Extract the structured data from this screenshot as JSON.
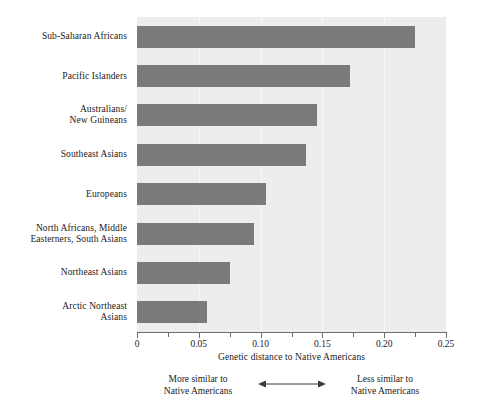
{
  "chart_data": {
    "type": "bar",
    "orientation": "horizontal",
    "title": "",
    "xlabel": "Genetic distance to Native Americans",
    "ylabel": "",
    "xlim": [
      0,
      0.25
    ],
    "grid": true,
    "legend": null,
    "categories": [
      "Sub-Saharan Africans",
      "Pacific Islanders",
      "Australians/\nNew Guineans",
      "Southeast Asians",
      "Europeans",
      "North Africans, Middle\nEasterners, South Asians",
      "Northeast Asians",
      "Arctic Northeast\nAsians"
    ],
    "values": [
      0.225,
      0.172,
      0.146,
      0.137,
      0.104,
      0.095,
      0.075,
      0.057
    ],
    "xticks": [
      0,
      0.025,
      0.05,
      0.075,
      0.1,
      0.125,
      0.15,
      0.175,
      0.2,
      0.225,
      0.25
    ],
    "xtick_labels": [
      "0",
      "",
      "0.05",
      "",
      "0.10",
      "",
      "0.15",
      "",
      "0.20",
      "",
      "0.25"
    ],
    "bar_color": "#7a7a7a",
    "plot_background": "#ededed",
    "gridline_color": "#f7f7f7",
    "annotation": {
      "left_line1": "More similar to",
      "left_line2": "Native Americans",
      "right_line1": "Less similar to",
      "right_line2": "Native Americans",
      "arrow": "double-headed-horizontal-arrow"
    }
  },
  "categories_display": [
    {
      "line1": "Sub-Saharan Africans",
      "line2": ""
    },
    {
      "line1": "Pacific Islanders",
      "line2": ""
    },
    {
      "line1": "Australians/",
      "line2": "New Guineans"
    },
    {
      "line1": "Southeast Asians",
      "line2": ""
    },
    {
      "line1": "Europeans",
      "line2": ""
    },
    {
      "line1": "North Africans, Middle",
      "line2": "Easterners, South Asians"
    },
    {
      "line1": "Northeast Asians",
      "line2": ""
    },
    {
      "line1": "Arctic Northeast",
      "line2": "Asians"
    }
  ],
  "axis": {
    "title": "Genetic distance to Native Americans",
    "tick_labels": [
      "0",
      "0.05",
      "0.10",
      "0.15",
      "0.20",
      "0.25"
    ]
  },
  "annotation": {
    "left_line1": "More similar to",
    "left_line2": "Native Americans",
    "right_line1": "Less similar to",
    "right_line2": "Native Americans"
  }
}
